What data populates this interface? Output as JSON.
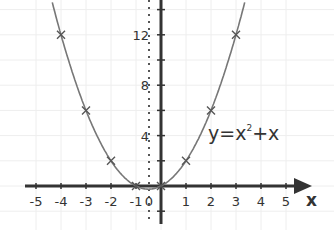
{
  "chart_data": {
    "type": "line",
    "title": "",
    "equation": "y=x²+x",
    "equation_parts": {
      "base": "y=x",
      "exp": "2",
      "rest": "+x"
    },
    "xlabel": "x",
    "ylabel": "",
    "x_ticks": [
      "-5",
      "-4",
      "-3",
      "-2",
      "-1",
      "0",
      "1",
      "2",
      "3",
      "4",
      "5"
    ],
    "y_ticks": [
      "4",
      "8",
      "12"
    ],
    "xlim": [
      -5.5,
      6
    ],
    "ylim": [
      -3,
      15
    ],
    "grid": true,
    "series": [
      {
        "name": "y=x²+x",
        "marked_points": [
          {
            "x": -4,
            "y": 12
          },
          {
            "x": -3,
            "y": 6
          },
          {
            "x": -2,
            "y": 2
          },
          {
            "x": -1,
            "y": 0
          },
          {
            "x": 0,
            "y": 0
          },
          {
            "x": 1,
            "y": 2
          },
          {
            "x": 2,
            "y": 6
          },
          {
            "x": 3,
            "y": 12
          }
        ]
      }
    ],
    "colors": {
      "curve": "#777777",
      "axis": "#333333",
      "grid": "#eeeeee"
    }
  }
}
